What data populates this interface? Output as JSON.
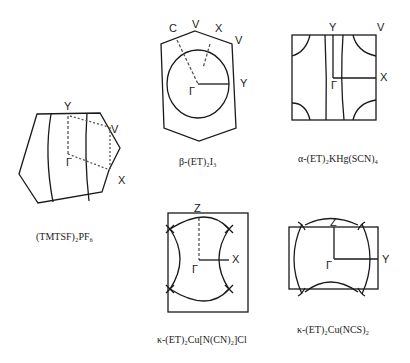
{
  "panels": [
    {
      "id": "tmtsf",
      "caption": "(TMTSF)₂PF₆",
      "points": [
        "Y",
        "V",
        "Γ",
        "X"
      ]
    },
    {
      "id": "beta",
      "caption": "β-(ET)₂I₃",
      "points": [
        "C",
        "V",
        "X",
        "V",
        "Y",
        "Γ"
      ]
    },
    {
      "id": "alpha",
      "caption": "α-(ET)₂KHg(SCN)₄",
      "points": [
        "Y",
        "V",
        "X",
        "Γ"
      ]
    },
    {
      "id": "kappa-cl",
      "caption": "κ-(ET)₂Cu[N(CN)₂]Cl",
      "points": [
        "Z",
        "X",
        "Γ"
      ]
    },
    {
      "id": "kappa-ncs",
      "caption": "κ-(ET)₂Cu(NCS)₂",
      "points": [
        "Z",
        "Y",
        "Γ"
      ]
    }
  ],
  "colors": {
    "line": "#1a1a1a",
    "dashed": "#555555",
    "background": "#ffffff"
  }
}
